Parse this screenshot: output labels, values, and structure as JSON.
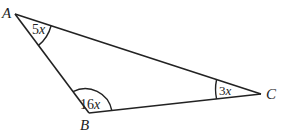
{
  "figure": {
    "type": "triangle",
    "vertices": [
      {
        "name": "A",
        "x": 15,
        "y": 14
      },
      {
        "name": "B",
        "x": 89,
        "y": 113
      },
      {
        "name": "C",
        "x": 261,
        "y": 94
      }
    ],
    "labels": {
      "A": "A",
      "B": "B",
      "C": "C"
    },
    "angles": {
      "A": {
        "coef": "5",
        "var": "x"
      },
      "B": {
        "coef": "16",
        "var": "x"
      },
      "C": {
        "coef": "3",
        "var": "x"
      }
    },
    "colors": {
      "stroke": "#222222",
      "background": "#ffffff"
    }
  }
}
